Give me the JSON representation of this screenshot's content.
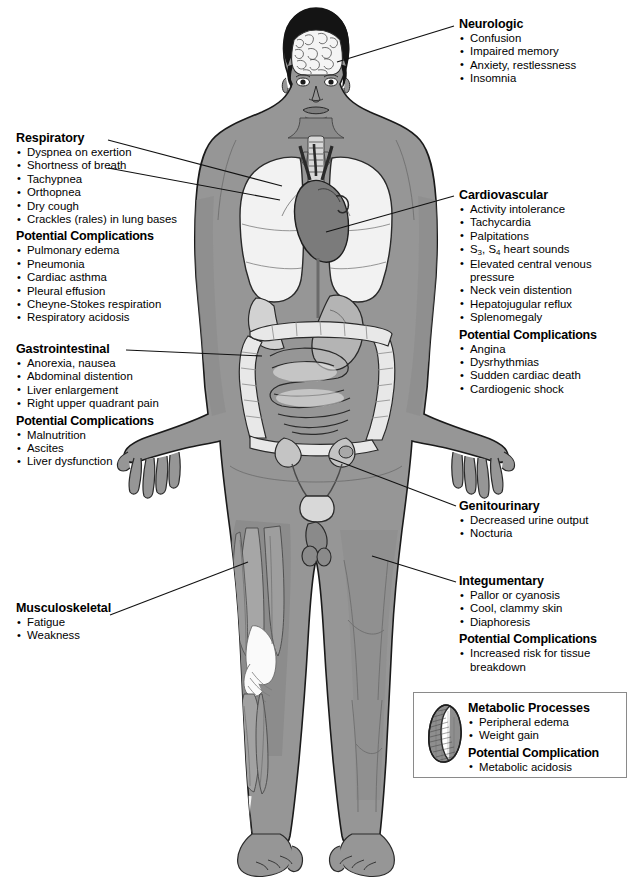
{
  "diagram": {
    "body_figure_name": "full-body-anatomical-figure",
    "colors": {
      "skin": "#969696",
      "organ_light": "#efefef",
      "organ_mid": "#c8c8c8",
      "organ_dark": "#6e6e6e",
      "outline": "#1a1a1a",
      "leader_line": "#111111",
      "box_border": "#8a8a8a",
      "background": "#ffffff"
    }
  },
  "callouts": {
    "neurologic": {
      "heading": "Neurologic",
      "items": [
        "Confusion",
        "Impaired memory",
        "Anxiety, restlessness",
        "Insomnia"
      ]
    },
    "respiratory": {
      "heading": "Respiratory",
      "items": [
        "Dyspnea on exertion",
        "Shortness of breath",
        "Tachypnea",
        "Orthopnea",
        "Dry cough",
        "Crackles (rales) in lung bases"
      ],
      "complications_heading": "Potential Complications",
      "complications": [
        "Pulmonary edema",
        "Pneumonia",
        "Cardiac asthma",
        "Pleural effusion",
        "Cheyne-Stokes respiration",
        "Respiratory acidosis"
      ]
    },
    "cardiovascular": {
      "heading": "Cardiovascular",
      "items": [
        "Activity intolerance",
        "Tachycardia",
        "Palpitations",
        "S3, S4 heart sounds",
        "Elevated central venous",
        "pressure",
        "Neck vein distention",
        "Hepatojugular reflux",
        "Splenomegaly"
      ],
      "heart_sounds_prefix": "S",
      "heart_sounds_sub1": "3",
      "heart_sounds_mid": ", S",
      "heart_sounds_sub2": "4",
      "heart_sounds_suffix": " heart sounds",
      "complications_heading": "Potential Complications",
      "complications": [
        "Angina",
        "Dysrhythmias",
        "Sudden cardiac death",
        "Cardiogenic shock"
      ]
    },
    "gastrointestinal": {
      "heading": "Gastrointestinal",
      "items": [
        "Anorexia, nausea",
        "Abdominal distention",
        "Liver enlargement",
        "Right upper quadrant pain"
      ],
      "complications_heading": "Potential Complications",
      "complications": [
        "Malnutrition",
        "Ascites",
        "Liver dysfunction"
      ]
    },
    "genitourinary": {
      "heading": "Genitourinary",
      "items": [
        "Decreased urine output",
        "Nocturia"
      ]
    },
    "integumentary": {
      "heading": "Integumentary",
      "items": [
        "Pallor or cyanosis",
        "Cool, clammy skin",
        "Diaphoresis"
      ],
      "complications_heading": "Potential Complications",
      "complications": [
        "Increased risk for tissue",
        "breakdown"
      ]
    },
    "musculoskeletal": {
      "heading": "Musculoskeletal",
      "items": [
        "Fatigue",
        "Weakness"
      ]
    },
    "metabolic": {
      "heading": "Metabolic Processes",
      "items": [
        "Peripheral edema",
        "Weight gain"
      ],
      "complications_heading": "Potential Complication",
      "complications": [
        "Metabolic acidosis"
      ],
      "icon": "kidney-icon"
    }
  }
}
